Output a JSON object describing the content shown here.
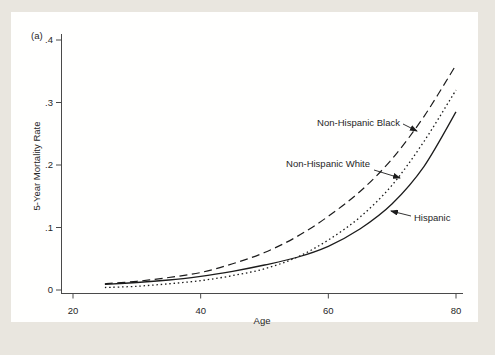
{
  "panel_label": "(a)",
  "colors": {
    "background": "#e9e6df",
    "panel": "#fffffe",
    "line": "#1c1c1c",
    "axis": "#4a4a4a",
    "text": "#262626"
  },
  "chart_data": {
    "type": "line",
    "title": "",
    "xlabel": "Age",
    "ylabel": "5-Year Mortality Rate",
    "xlim": [
      20,
      80
    ],
    "ylim": [
      0,
      0.4
    ],
    "grid": false,
    "legend_position": "inline-annotations",
    "x_ticks": [
      20,
      40,
      60,
      80
    ],
    "x_tick_labels": [
      "20",
      "40",
      "60",
      "80"
    ],
    "y_ticks": [
      0,
      0.1,
      0.2,
      0.3,
      0.4
    ],
    "y_tick_labels": [
      "0",
      ".1",
      ".2",
      ".3",
      ".4"
    ],
    "x": [
      25,
      30,
      35,
      40,
      45,
      50,
      55,
      60,
      65,
      70,
      75,
      80
    ],
    "series": [
      {
        "name": "Non-Hispanic Black",
        "style": "long-dash",
        "values": [
          0.01,
          0.014,
          0.02,
          0.028,
          0.042,
          0.06,
          0.085,
          0.118,
          0.158,
          0.21,
          0.278,
          0.36
        ]
      },
      {
        "name": "Non-Hispanic White",
        "style": "dotted",
        "values": [
          0.004,
          0.006,
          0.01,
          0.015,
          0.023,
          0.034,
          0.052,
          0.08,
          0.117,
          0.168,
          0.238,
          0.32
        ]
      },
      {
        "name": "Hispanic",
        "style": "solid",
        "values": [
          0.009,
          0.012,
          0.016,
          0.022,
          0.03,
          0.04,
          0.052,
          0.07,
          0.098,
          0.138,
          0.198,
          0.285
        ]
      }
    ],
    "annotations": [
      {
        "label": "Non-Hispanic Black",
        "text_x": 400,
        "text_y": 126,
        "anchor": "end",
        "arrow": [
          403,
          124,
          417,
          131
        ]
      },
      {
        "label": "Non-Hispanic White",
        "text_x": 370,
        "text_y": 167,
        "anchor": "end",
        "arrow": [
          374,
          170,
          400,
          178
        ]
      },
      {
        "label": "Hispanic",
        "text_x": 414,
        "text_y": 221,
        "anchor": "start",
        "arrow": [
          411,
          216,
          391,
          211
        ]
      }
    ]
  }
}
